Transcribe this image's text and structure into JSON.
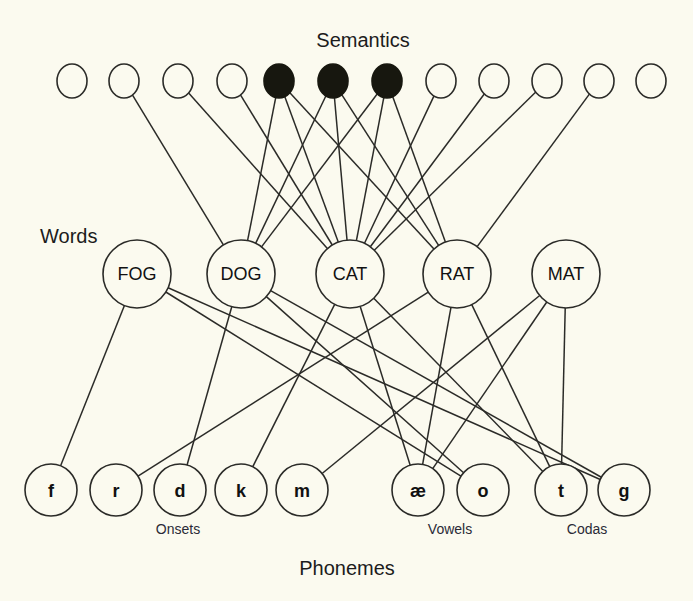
{
  "canvas": {
    "width": 693,
    "height": 601,
    "background": "#fbfaef"
  },
  "titles": {
    "semantics": "Semantics",
    "words": "Words",
    "phonemes": "Phonemes"
  },
  "group_labels": {
    "onsets": "Onsets",
    "vowels": "Vowels",
    "codas": "Codas"
  },
  "colors": {
    "ink": "#2b2b28",
    "paper": "#fbfaef",
    "node_active": "#17170f",
    "label": "#2a2a37"
  },
  "semantics": {
    "title_pos": {
      "x": 363,
      "y": 47
    },
    "radius": 15,
    "cy": 81,
    "nodes": [
      {
        "id": "s1",
        "cx": 72,
        "active": false
      },
      {
        "id": "s2",
        "cx": 124,
        "active": false
      },
      {
        "id": "s3",
        "cx": 178,
        "active": false
      },
      {
        "id": "s4",
        "cx": 232,
        "active": false
      },
      {
        "id": "s5",
        "cx": 279,
        "active": true
      },
      {
        "id": "s6",
        "cx": 333,
        "active": true
      },
      {
        "id": "s7",
        "cx": 387,
        "active": true
      },
      {
        "id": "s8",
        "cx": 441,
        "active": false
      },
      {
        "id": "s9",
        "cx": 494,
        "active": false
      },
      {
        "id": "s10",
        "cx": 547,
        "active": false
      },
      {
        "id": "s11",
        "cx": 599,
        "active": false
      },
      {
        "id": "s12",
        "cx": 651,
        "active": false
      }
    ]
  },
  "words": {
    "title_pos": {
      "x": 40,
      "y": 243
    },
    "radius": 34,
    "cy": 274,
    "nodes": [
      {
        "id": "FOG",
        "label": "FOG",
        "cx": 137
      },
      {
        "id": "DOG",
        "label": "DOG",
        "cx": 241
      },
      {
        "id": "CAT",
        "label": "CAT",
        "cx": 350
      },
      {
        "id": "RAT",
        "label": "RAT",
        "cx": 457
      },
      {
        "id": "MAT",
        "label": "MAT",
        "cx": 566
      }
    ]
  },
  "phonemes": {
    "title_pos": {
      "x": 347,
      "y": 575
    },
    "radius": 26,
    "cy": 490,
    "nodes": [
      {
        "id": "f",
        "label": "f",
        "cx": 51,
        "group": "onsets"
      },
      {
        "id": "r",
        "label": "r",
        "cx": 116,
        "group": "onsets"
      },
      {
        "id": "d",
        "label": "d",
        "cx": 180,
        "group": "onsets"
      },
      {
        "id": "k",
        "label": "k",
        "cx": 241,
        "group": "onsets"
      },
      {
        "id": "m",
        "label": "m",
        "cx": 302,
        "group": "onsets"
      },
      {
        "id": "ae",
        "label": "æ",
        "cx": 418,
        "group": "vowels"
      },
      {
        "id": "o",
        "label": "o",
        "cx": 483,
        "group": "vowels"
      },
      {
        "id": "t",
        "label": "t",
        "cx": 561,
        "group": "codas"
      },
      {
        "id": "g",
        "label": "g",
        "cx": 624,
        "group": "codas"
      }
    ],
    "group_label_pos": {
      "onsets": {
        "x": 178,
        "y": 534
      },
      "vowels": {
        "x": 450,
        "y": 534
      },
      "codas": {
        "x": 587,
        "y": 534
      }
    }
  },
  "edges_semantics_words": [
    {
      "from": "s2",
      "to": "DOG"
    },
    {
      "from": "s3",
      "to": "CAT"
    },
    {
      "from": "s4",
      "to": "CAT"
    },
    {
      "from": "s5",
      "to": "DOG"
    },
    {
      "from": "s5",
      "to": "CAT"
    },
    {
      "from": "s5",
      "to": "RAT"
    },
    {
      "from": "s6",
      "to": "DOG"
    },
    {
      "from": "s6",
      "to": "CAT"
    },
    {
      "from": "s6",
      "to": "RAT"
    },
    {
      "from": "s7",
      "to": "DOG"
    },
    {
      "from": "s7",
      "to": "CAT"
    },
    {
      "from": "s7",
      "to": "RAT"
    },
    {
      "from": "s8",
      "to": "CAT"
    },
    {
      "from": "s9",
      "to": "CAT"
    },
    {
      "from": "s10",
      "to": "CAT"
    },
    {
      "from": "s11",
      "to": "RAT"
    }
  ],
  "edges_words_phonemes": [
    {
      "from": "FOG",
      "to": "f"
    },
    {
      "from": "FOG",
      "to": "o"
    },
    {
      "from": "FOG",
      "to": "g"
    },
    {
      "from": "DOG",
      "to": "d"
    },
    {
      "from": "DOG",
      "to": "o"
    },
    {
      "from": "DOG",
      "to": "g"
    },
    {
      "from": "CAT",
      "to": "k"
    },
    {
      "from": "CAT",
      "to": "ae"
    },
    {
      "from": "CAT",
      "to": "t"
    },
    {
      "from": "RAT",
      "to": "r"
    },
    {
      "from": "RAT",
      "to": "ae"
    },
    {
      "from": "RAT",
      "to": "t"
    },
    {
      "from": "MAT",
      "to": "m"
    },
    {
      "from": "MAT",
      "to": "ae"
    },
    {
      "from": "MAT",
      "to": "t"
    }
  ]
}
